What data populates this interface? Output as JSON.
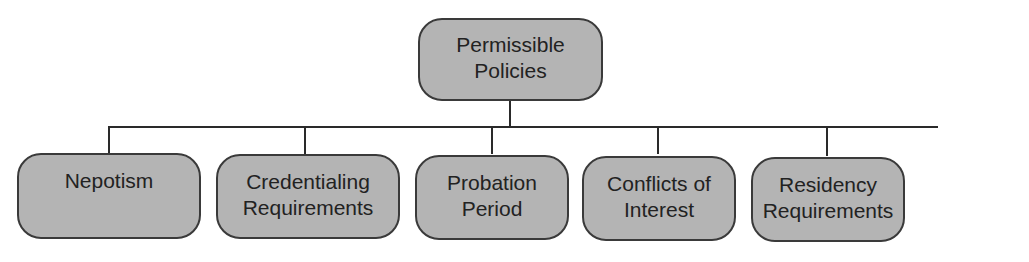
{
  "diagram": {
    "type": "org-chart",
    "root": {
      "label_line1": "Permissible",
      "label_line2": "Policies"
    },
    "children": [
      {
        "label_line1": "Nepotism",
        "label_line2": ""
      },
      {
        "label_line1": "Credentialing",
        "label_line2": "Requirements"
      },
      {
        "label_line1": "Probation",
        "label_line2": "Period"
      },
      {
        "label_line1": "Conflicts of",
        "label_line2": "Interest"
      },
      {
        "label_line1": "Residency",
        "label_line2": "Requirements"
      }
    ],
    "colors": {
      "box_fill": "#b4b4b4",
      "box_border": "#3a3a3a",
      "connector": "#2a2a2a",
      "text": "#222222"
    }
  }
}
